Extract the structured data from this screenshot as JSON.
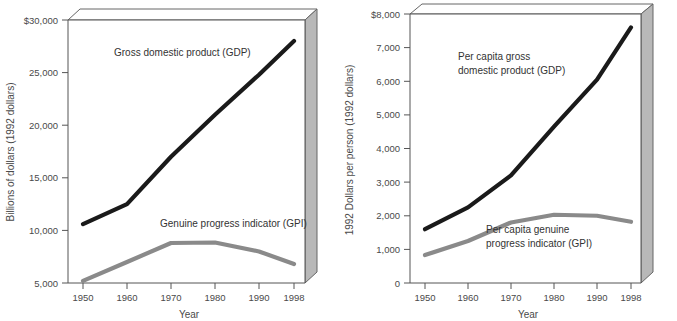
{
  "figure": {
    "title": "",
    "panel_count": 2
  },
  "chart_data": [
    {
      "id": "left",
      "type": "line",
      "title": "",
      "xlabel": "Year",
      "ylabel": "Billions of dollars (1992 dollars)",
      "categories": [
        "1950",
        "1960",
        "1970",
        "1980",
        "1990",
        "1998"
      ],
      "x": [
        1950,
        1960,
        1970,
        1980,
        1990,
        1998
      ],
      "ylim": [
        5000,
        30000
      ],
      "yticks": [
        5000,
        10000,
        15000,
        20000,
        25000,
        30000
      ],
      "ytick_labels": [
        "5,000",
        "10,000",
        "15,000",
        "20,000",
        "25,000",
        "$30,000"
      ],
      "xtick_labels": [
        "1950",
        "1960",
        "1970",
        "1980",
        "1990",
        "1998"
      ],
      "grid": false,
      "legend": "inline-annotations",
      "series": [
        {
          "name": "Gross domestic product (GDP)",
          "color": "#1a1a1a",
          "values": [
            10600,
            12500,
            17000,
            21000,
            24800,
            28000
          ]
        },
        {
          "name": "Genuine progress indicator (GPI)",
          "color": "#8a8a8a",
          "values": [
            5200,
            7000,
            8800,
            8850,
            8000,
            6800
          ]
        }
      ],
      "annotations": [
        {
          "text": "Gross domestic product (GDP)",
          "x": 1955.5,
          "y": 26900
        },
        {
          "text": "Genuine progress indicator (GPI)",
          "x": 1968.5,
          "y": 11000
        }
      ]
    },
    {
      "id": "right",
      "type": "line",
      "title": "",
      "xlabel": "Year",
      "ylabel": "1992 Dollars per person (1992 dollars)",
      "categories": [
        "1950",
        "1960",
        "1970",
        "1980",
        "1990",
        "1998"
      ],
      "x": [
        1950,
        1960,
        1970,
        1980,
        1990,
        1998
      ],
      "ylim": [
        0,
        8000
      ],
      "yticks": [
        0,
        1000,
        2000,
        3000,
        4000,
        5000,
        6000,
        7000,
        8000
      ],
      "ytick_labels": [
        "0",
        "1,000",
        "2,000",
        "3,000",
        "4,000",
        "5,000",
        "6,000",
        "7,000",
        "$8,000"
      ],
      "xtick_labels": [
        "1950",
        "1960",
        "1970",
        "1980",
        "1990",
        "1998"
      ],
      "grid": false,
      "legend": "inline-annotations",
      "series": [
        {
          "name": "Per capita gross domestic product (GDP)",
          "color": "#1a1a1a",
          "values": [
            1600,
            2250,
            3200,
            4650,
            6050,
            7600
          ]
        },
        {
          "name": "Per capita genuine progress indicator (GPI)",
          "color": "#8a8a8a",
          "values": [
            830,
            1250,
            1800,
            2030,
            2000,
            1820
          ]
        }
      ],
      "annotations": [
        {
          "text_line1": "Per capita gross",
          "text_line2": "domestic product (GDP)",
          "x": 1962,
          "y": 6750
        },
        {
          "text_line1": "Per capita genuine",
          "text_line2": "progress indicator (GPI)",
          "x": 1975,
          "y": 1550
        }
      ]
    }
  ],
  "colors": {
    "gdp_line": "#1a1a1a",
    "gpi_line": "#8a8a8a",
    "frame": "#555555",
    "box_side": "#b8b8b8",
    "text": "#4a4a4a",
    "background": "#ffffff"
  }
}
